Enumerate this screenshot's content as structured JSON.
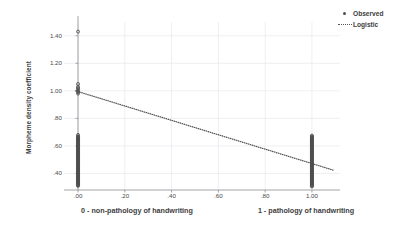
{
  "chart_data": {
    "type": "scatter",
    "title": "",
    "subtitle": "",
    "xlabel": "",
    "ylabel": "Morpheme density coefficient",
    "xlim": [
      -0.06,
      1.12
    ],
    "ylim": [
      0.28,
      1.5
    ],
    "grid": true,
    "x_ticks": [
      0.0,
      0.2,
      0.4,
      0.6,
      0.8,
      1.0
    ],
    "x_tick_labels": [
      ".00",
      ".20",
      ".40",
      ".60",
      ".80",
      "1.00"
    ],
    "y_ticks": [
      0.4,
      0.6,
      0.8,
      1.0,
      1.2,
      1.4
    ],
    "y_tick_labels": [
      ".40",
      ".60",
      ".80",
      "1.00",
      "1.20",
      "1.40"
    ],
    "x_group_captions": [
      "0 - non-pathology of handwriting",
      "1 - pathology of handwriting"
    ],
    "legend_position": "top-right",
    "legend": [
      "Observed",
      "Logistic"
    ],
    "series": [
      {
        "name": "Observed",
        "type": "scatter",
        "marker": "circle",
        "color": "#4d4d4d",
        "points": [
          [
            0.0,
            1.43
          ],
          [
            0.0,
            1.05
          ],
          [
            0.0,
            1.03
          ],
          [
            0.0,
            1.02
          ],
          [
            0.0,
            1.01
          ],
          [
            0.0,
            1.0
          ],
          [
            0.0,
            0.99
          ],
          [
            0.0,
            0.98
          ],
          [
            0.0,
            0.68
          ],
          [
            0.0,
            0.67
          ],
          [
            0.0,
            0.665
          ],
          [
            0.0,
            0.66
          ],
          [
            0.0,
            0.655
          ],
          [
            0.0,
            0.65
          ],
          [
            0.0,
            0.645
          ],
          [
            0.0,
            0.64
          ],
          [
            0.0,
            0.635
          ],
          [
            0.0,
            0.63
          ],
          [
            0.0,
            0.625
          ],
          [
            0.0,
            0.62
          ],
          [
            0.0,
            0.615
          ],
          [
            0.0,
            0.61
          ],
          [
            0.0,
            0.605
          ],
          [
            0.0,
            0.6
          ],
          [
            0.0,
            0.595
          ],
          [
            0.0,
            0.59
          ],
          [
            0.0,
            0.585
          ],
          [
            0.0,
            0.58
          ],
          [
            0.0,
            0.575
          ],
          [
            0.0,
            0.57
          ],
          [
            0.0,
            0.565
          ],
          [
            0.0,
            0.56
          ],
          [
            0.0,
            0.555
          ],
          [
            0.0,
            0.55
          ],
          [
            0.0,
            0.545
          ],
          [
            0.0,
            0.54
          ],
          [
            0.0,
            0.535
          ],
          [
            0.0,
            0.53
          ],
          [
            0.0,
            0.525
          ],
          [
            0.0,
            0.52
          ],
          [
            0.0,
            0.515
          ],
          [
            0.0,
            0.51
          ],
          [
            0.0,
            0.505
          ],
          [
            0.0,
            0.5
          ],
          [
            0.0,
            0.495
          ],
          [
            0.0,
            0.49
          ],
          [
            0.0,
            0.485
          ],
          [
            0.0,
            0.48
          ],
          [
            0.0,
            0.475
          ],
          [
            0.0,
            0.47
          ],
          [
            0.0,
            0.465
          ],
          [
            0.0,
            0.46
          ],
          [
            0.0,
            0.455
          ],
          [
            0.0,
            0.45
          ],
          [
            0.0,
            0.445
          ],
          [
            0.0,
            0.44
          ],
          [
            0.0,
            0.435
          ],
          [
            0.0,
            0.43
          ],
          [
            0.0,
            0.425
          ],
          [
            0.0,
            0.42
          ],
          [
            0.0,
            0.415
          ],
          [
            0.0,
            0.41
          ],
          [
            0.0,
            0.405
          ],
          [
            0.0,
            0.4
          ],
          [
            0.0,
            0.395
          ],
          [
            0.0,
            0.39
          ],
          [
            0.0,
            0.385
          ],
          [
            0.0,
            0.38
          ],
          [
            0.0,
            0.375
          ],
          [
            0.0,
            0.37
          ],
          [
            0.0,
            0.365
          ],
          [
            0.0,
            0.36
          ],
          [
            0.0,
            0.355
          ],
          [
            0.0,
            0.35
          ],
          [
            0.0,
            0.345
          ],
          [
            0.0,
            0.34
          ],
          [
            0.0,
            0.335
          ],
          [
            0.0,
            0.33
          ],
          [
            0.0,
            0.325
          ],
          [
            0.0,
            0.32
          ],
          [
            0.0,
            0.315
          ],
          [
            0.0,
            0.31
          ],
          [
            1.0,
            0.675
          ],
          [
            1.0,
            0.67
          ],
          [
            1.0,
            0.665
          ],
          [
            1.0,
            0.66
          ],
          [
            1.0,
            0.655
          ],
          [
            1.0,
            0.65
          ],
          [
            1.0,
            0.645
          ],
          [
            1.0,
            0.64
          ],
          [
            1.0,
            0.635
          ],
          [
            1.0,
            0.63
          ],
          [
            1.0,
            0.625
          ],
          [
            1.0,
            0.62
          ],
          [
            1.0,
            0.615
          ],
          [
            1.0,
            0.61
          ],
          [
            1.0,
            0.605
          ],
          [
            1.0,
            0.6
          ],
          [
            1.0,
            0.595
          ],
          [
            1.0,
            0.59
          ],
          [
            1.0,
            0.585
          ],
          [
            1.0,
            0.58
          ],
          [
            1.0,
            0.575
          ],
          [
            1.0,
            0.57
          ],
          [
            1.0,
            0.565
          ],
          [
            1.0,
            0.56
          ],
          [
            1.0,
            0.555
          ],
          [
            1.0,
            0.55
          ],
          [
            1.0,
            0.545
          ],
          [
            1.0,
            0.54
          ],
          [
            1.0,
            0.535
          ],
          [
            1.0,
            0.53
          ],
          [
            1.0,
            0.525
          ],
          [
            1.0,
            0.52
          ],
          [
            1.0,
            0.515
          ],
          [
            1.0,
            0.51
          ],
          [
            1.0,
            0.505
          ],
          [
            1.0,
            0.5
          ],
          [
            1.0,
            0.495
          ],
          [
            1.0,
            0.49
          ],
          [
            1.0,
            0.485
          ],
          [
            1.0,
            0.48
          ],
          [
            1.0,
            0.475
          ],
          [
            1.0,
            0.47
          ],
          [
            1.0,
            0.465
          ],
          [
            1.0,
            0.46
          ],
          [
            1.0,
            0.455
          ],
          [
            1.0,
            0.45
          ],
          [
            1.0,
            0.445
          ],
          [
            1.0,
            0.44
          ],
          [
            1.0,
            0.435
          ],
          [
            1.0,
            0.43
          ],
          [
            1.0,
            0.425
          ],
          [
            1.0,
            0.42
          ],
          [
            1.0,
            0.415
          ],
          [
            1.0,
            0.41
          ],
          [
            1.0,
            0.405
          ],
          [
            1.0,
            0.4
          ],
          [
            1.0,
            0.395
          ],
          [
            1.0,
            0.39
          ],
          [
            1.0,
            0.385
          ],
          [
            1.0,
            0.38
          ],
          [
            1.0,
            0.375
          ],
          [
            1.0,
            0.37
          ],
          [
            1.0,
            0.365
          ],
          [
            1.0,
            0.36
          ],
          [
            1.0,
            0.355
          ],
          [
            1.0,
            0.35
          ],
          [
            1.0,
            0.345
          ],
          [
            1.0,
            0.34
          ],
          [
            1.0,
            0.335
          ],
          [
            1.0,
            0.33
          ],
          [
            1.0,
            0.325
          ],
          [
            1.0,
            0.32
          ],
          [
            1.0,
            0.315
          ],
          [
            1.0,
            0.31
          ],
          [
            1.0,
            0.305
          ]
        ]
      },
      {
        "name": "Logistic",
        "type": "line",
        "style": "dotted",
        "color": "#555555",
        "x_start": -0.01,
        "x_end": 1.09,
        "y_start": 1.0,
        "y_end": 0.425
      }
    ]
  },
  "legend": {
    "items": [
      {
        "label": "Observed",
        "marker": "dot",
        "color": "#4d4d4d"
      },
      {
        "label": "Logistic",
        "marker": "dash",
        "color": "#555555"
      }
    ]
  },
  "axes": {
    "y_title": "Morpheme density coefficient",
    "y_tick_labels": [
      ".40",
      ".60",
      ".80",
      "1.00",
      "1.20",
      "1.40"
    ],
    "x_tick_labels": [
      ".00",
      ".20",
      ".40",
      ".60",
      ".80",
      "1.00"
    ],
    "x_caption_left": "0 - non-pathology of handwriting",
    "x_caption_right": "1 - pathology of handwriting"
  },
  "style": {
    "grid_color": "#e8e8ec",
    "axis_color": "#9a9aa0",
    "marker_color": "#4d4d4d",
    "line_color": "#555555",
    "text_color": "#3d3d3d",
    "background": "#ffffff"
  }
}
